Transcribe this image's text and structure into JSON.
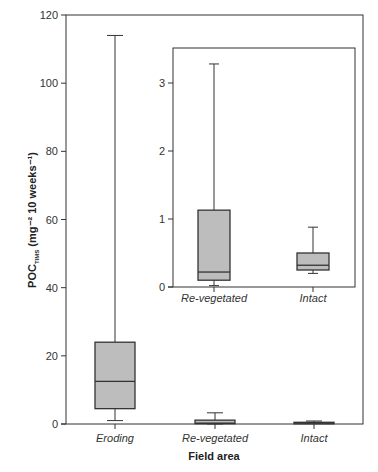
{
  "chart_data": [
    {
      "type": "box",
      "title": "",
      "xlabel": "Field area",
      "ylabel": "POC_TIMS (mg⁻² 10 weeks⁻¹)",
      "ylabel_main": "POC",
      "ylabel_sub": "TIMS",
      "ylabel_units": " (mg⁻² 10 weeks⁻¹)",
      "ylim": [
        0,
        120
      ],
      "yticks": [
        0,
        20,
        40,
        60,
        80,
        100,
        120
      ],
      "categories": [
        "Eroding",
        "Re-vegetated",
        "Intact"
      ],
      "series": [
        {
          "name": "Eroding",
          "whisker_low": 1,
          "q1": 4.5,
          "median": 12.5,
          "q3": 24,
          "whisker_high": 114
        },
        {
          "name": "Re-vegetated",
          "whisker_low": 0.02,
          "q1": 0.1,
          "median": 0.22,
          "q3": 1.13,
          "whisker_high": 3.28
        },
        {
          "name": "Intact",
          "whisker_low": 0.2,
          "q1": 0.25,
          "median": 0.32,
          "q3": 0.5,
          "whisker_high": 0.88
        }
      ],
      "grid": false,
      "legend": "none"
    },
    {
      "type": "box",
      "title": "Inset",
      "xlabel": "",
      "ylabel": "",
      "ylim": [
        0,
        3.5
      ],
      "yticks": [
        0,
        1,
        2,
        3
      ],
      "categories": [
        "Re-vegetated",
        "Intact"
      ],
      "series": [
        {
          "name": "Re-vegetated",
          "whisker_low": 0.02,
          "q1": 0.1,
          "median": 0.22,
          "q3": 1.13,
          "whisker_high": 3.28
        },
        {
          "name": "Intact",
          "whisker_low": 0.2,
          "q1": 0.25,
          "median": 0.32,
          "q3": 0.5,
          "whisker_high": 0.88
        }
      ],
      "grid": false,
      "legend": "none"
    }
  ],
  "colors": {
    "box_fill": "#bdbdbd",
    "line": "#333333"
  }
}
